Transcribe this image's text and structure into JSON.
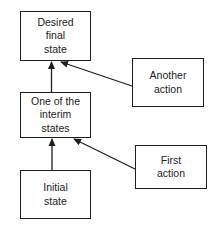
{
  "diagram": {
    "type": "flow",
    "colors": {
      "stroke": "#1e1e1e",
      "text": "#222222",
      "background": "#ffffff"
    },
    "nodes": [
      {
        "id": "final",
        "label": "Desired\nfinal\nstate",
        "x": 20,
        "y": 11,
        "w": 71,
        "h": 50
      },
      {
        "id": "interim",
        "label": "One of the\ninterim\nstates",
        "x": 20,
        "y": 92,
        "w": 71,
        "h": 46
      },
      {
        "id": "initial",
        "label": "Initial\nstate",
        "x": 20,
        "y": 170,
        "w": 71,
        "h": 49
      },
      {
        "id": "another_action",
        "label": "Another\naction",
        "x": 132,
        "y": 58,
        "w": 72,
        "h": 49
      },
      {
        "id": "first_action",
        "label": "First\naction",
        "x": 135,
        "y": 145,
        "w": 72,
        "h": 44
      }
    ],
    "edges": [
      {
        "from": "interim",
        "to": "final"
      },
      {
        "from": "another_action",
        "to": "final"
      },
      {
        "from": "initial",
        "to": "interim"
      },
      {
        "from": "first_action",
        "to": "interim"
      }
    ]
  }
}
